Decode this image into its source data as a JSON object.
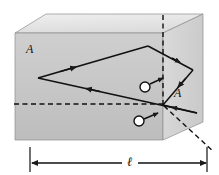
{
  "figure": {
    "type": "physics-optics-diagram",
    "labels": {
      "face_left_label": "A",
      "face_right_label": "A",
      "length_label": "ℓ"
    },
    "colors": {
      "top_face": "#e3e3e3",
      "front_face": "#c9c9c9",
      "left_face": "#b8b8b8",
      "right_face": "#d6d6d6",
      "stroke": "#1a1a1a",
      "background": "#ffffff"
    },
    "geometry": {
      "block": {
        "front_top_left": [
          15,
          33
        ],
        "front_top_right": [
          163,
          33
        ],
        "front_bottom_left": [
          15,
          140
        ],
        "front_bottom_right": [
          163,
          140
        ],
        "back_top_left": [
          46,
          14
        ],
        "back_top_right": [
          203,
          14
        ],
        "back_bottom_right": [
          203,
          122
        ]
      },
      "ray_vertices": [
        [
          38,
          78
        ],
        [
          148,
          46
        ],
        [
          193,
          70
        ],
        [
          163,
          105
        ],
        [
          197,
          113
        ],
        [
          163,
          105
        ]
      ]
    },
    "markers": [
      {
        "name": "angle-marker-upper",
        "cx": 145,
        "cy": 87,
        "r": 5
      },
      {
        "name": "angle-marker-lower",
        "cx": 139,
        "cy": 121,
        "r": 5
      }
    ],
    "dashed_lines": [
      {
        "name": "vertical-normal",
        "from": [
          163,
          15
        ],
        "to": [
          163,
          108
        ]
      },
      {
        "name": "horizontal-normal",
        "from": [
          14,
          104
        ],
        "to": [
          166,
          104
        ]
      },
      {
        "name": "exit-ray-extension",
        "from": [
          163,
          105
        ],
        "to": [
          213,
          151
        ]
      }
    ],
    "dimension": {
      "from_x": 30,
      "to_x": 207,
      "y": 163,
      "label": "ℓ"
    }
  }
}
